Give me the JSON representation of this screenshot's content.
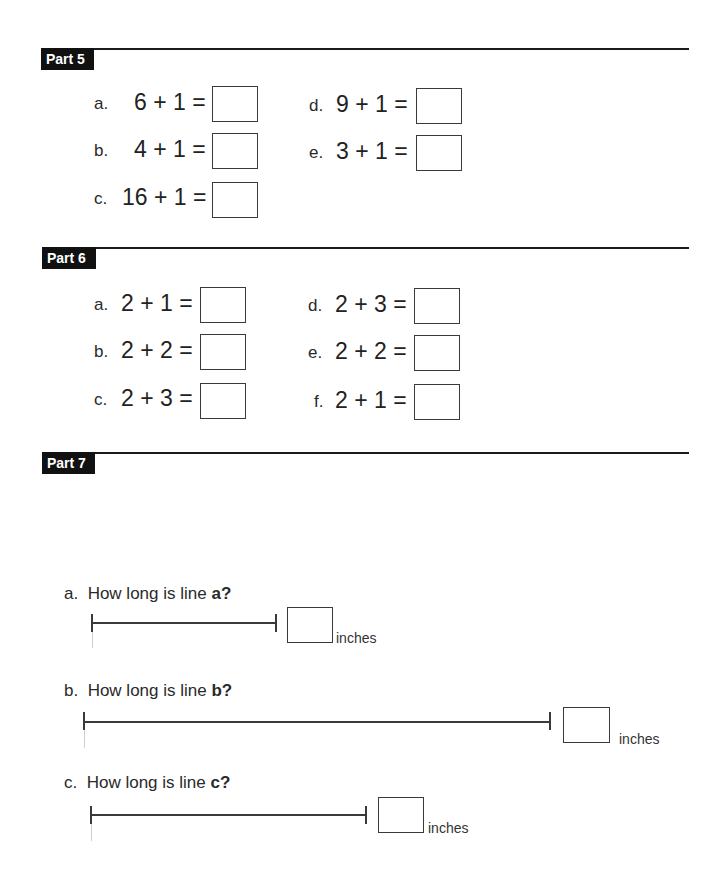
{
  "part5": {
    "label": "Part 5",
    "items": [
      {
        "letter": "a.",
        "expr": "6 + 1 ="
      },
      {
        "letter": "b.",
        "expr": "4 + 1 ="
      },
      {
        "letter": "c.",
        "expr": "16 + 1 ="
      },
      {
        "letter": "d.",
        "expr": "9 + 1 ="
      },
      {
        "letter": "e.",
        "expr": "3 + 1 ="
      }
    ]
  },
  "part6": {
    "label": "Part 6",
    "items": [
      {
        "letter": "a.",
        "expr": "2 + 1 ="
      },
      {
        "letter": "b.",
        "expr": "2 + 2 ="
      },
      {
        "letter": "c.",
        "expr": "2 + 3 ="
      },
      {
        "letter": "d.",
        "expr": "2 + 3 ="
      },
      {
        "letter": "e.",
        "expr": "2 + 2 ="
      },
      {
        "letter": "f.",
        "expr": "2 + 1 ="
      }
    ]
  },
  "part7": {
    "label": "Part 7",
    "questions": [
      {
        "letter": "a.",
        "prefix": "How long is line ",
        "target": "a?",
        "unit": "inches"
      },
      {
        "letter": "b.",
        "prefix": "How long is line ",
        "target": "b?",
        "unit": "inches"
      },
      {
        "letter": "c.",
        "prefix": "How long is line ",
        "target": "c?",
        "unit": "inches"
      }
    ]
  }
}
